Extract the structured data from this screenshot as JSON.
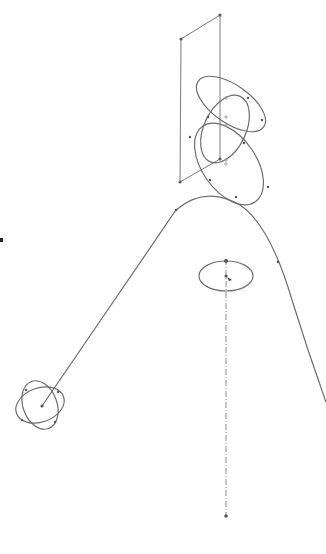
{
  "diagram": {
    "type": "cad-sketch-3d",
    "background": "#ffffff",
    "stroke_color": "#6e6e6e",
    "elements": [
      {
        "name": "reference-plane",
        "kind": "parallelogram",
        "points": [
          [
            181,
            39
          ],
          [
            220,
            15
          ],
          [
            220,
            159
          ],
          [
            180,
            182
          ]
        ]
      },
      {
        "name": "profile-ellipse-upper",
        "kind": "ellipse",
        "cx": 231,
        "cy": 104,
        "rx": 40,
        "ry": 19,
        "rotate": 35
      },
      {
        "name": "profile-ellipse-middle",
        "kind": "ellipse",
        "cx": 225,
        "cy": 129,
        "rx": 21,
        "ry": 36,
        "rotate": 25
      },
      {
        "name": "profile-ellipse-lower",
        "kind": "ellipse",
        "cx": 229,
        "cy": 164,
        "rx": 46,
        "ry": 27,
        "rotate": 55
      },
      {
        "name": "sweep-path",
        "kind": "path",
        "d": "M42,406 L176,210 Q205,185 240,205 Q270,225 292,300 Q308,352 326,402"
      },
      {
        "name": "center-ellipse",
        "kind": "ellipse",
        "cx": 226,
        "cy": 276,
        "rx": 27,
        "ry": 15,
        "rotate": 0
      },
      {
        "name": "centerline-axis",
        "kind": "line",
        "x1": 226,
        "y1": 259,
        "x2": 226,
        "y2": 516
      },
      {
        "name": "atom-ellipse-a",
        "kind": "ellipse",
        "cx": 40,
        "cy": 405,
        "rx": 25,
        "ry": 17,
        "rotate": -20
      },
      {
        "name": "atom-ellipse-b",
        "kind": "ellipse",
        "cx": 40,
        "cy": 405,
        "rx": 17,
        "ry": 25,
        "rotate": -20
      },
      {
        "name": "isolated-point",
        "kind": "point",
        "x": 1,
        "y": 240
      }
    ],
    "points": [
      [
        181,
        39
      ],
      [
        220,
        15
      ],
      [
        180,
        182
      ],
      [
        42,
        406
      ],
      [
        176,
        210
      ],
      [
        226,
        261
      ],
      [
        226,
        276
      ],
      [
        226,
        516
      ],
      [
        1,
        240
      ],
      [
        278,
        262
      ]
    ]
  }
}
